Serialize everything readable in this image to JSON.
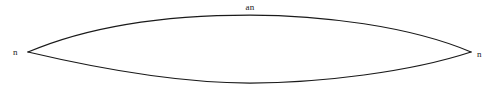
{
  "figure": {
    "type": "lens-diagram",
    "background_color": "#ffffff",
    "stroke_color": "#1a1a1a",
    "stroke_width": 1.25,
    "canvas": {
      "width": 500,
      "height": 90
    },
    "labels": {
      "top": "an",
      "left_vertex": "n",
      "right_vertex": "n"
    },
    "geometry": {
      "left_vertex": {
        "x": 28,
        "y": 52
      },
      "right_vertex": {
        "x": 471,
        "y": 52
      },
      "top_arc_peak": {
        "x": 250,
        "y": 15
      },
      "bottom_arc_trough": {
        "x": 250,
        "y": 83
      },
      "top_arc_path": "M 28 52 C 96 23, 180 15, 250 15 C 320 15, 410 26, 471 52",
      "bottom_arc_path": "M 28 52 C 96 68, 180 83, 250 83 C 320 83, 410 72, 471 52"
    }
  }
}
